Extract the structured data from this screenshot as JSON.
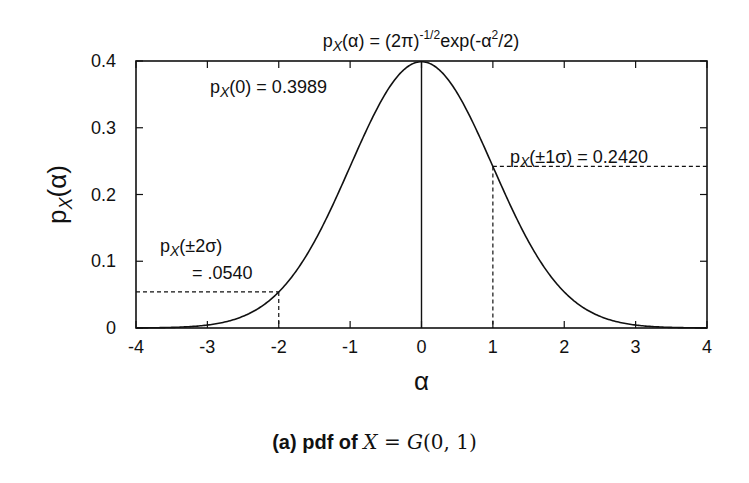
{
  "chart_data": {
    "type": "line",
    "title_parts": {
      "p": "p",
      "sub": "X",
      "mid": "(α) = (2π)",
      "sup1": "-1/2",
      "exp": "exp(-α",
      "sup2": "2",
      "end": "/2)"
    },
    "xlabel": "α",
    "ylabel": {
      "p": "p",
      "sub": "X",
      "rest": "(α)"
    },
    "xlim": [
      -4,
      4
    ],
    "ylim": [
      0,
      0.4
    ],
    "x_ticks": [
      "-4",
      "-3",
      "-2",
      "-1",
      "0",
      "1",
      "2",
      "3",
      "4"
    ],
    "y_ticks": [
      "0",
      "0.1",
      "0.2",
      "0.3",
      "0.4"
    ],
    "grid": false,
    "series": [
      {
        "name": "Standard normal pdf",
        "x": [
          -4,
          -3.5,
          -3,
          -2.5,
          -2,
          -1.5,
          -1,
          -0.5,
          0,
          0.5,
          1,
          1.5,
          2,
          2.5,
          3,
          3.5,
          4
        ],
        "values": [
          0.0001,
          0.0009,
          0.0044,
          0.0175,
          0.054,
          0.1295,
          0.242,
          0.3521,
          0.3989,
          0.3521,
          0.242,
          0.1295,
          0.054,
          0.0175,
          0.0044,
          0.0009,
          0.0001
        ]
      }
    ],
    "annotations": [
      {
        "label_p": "p",
        "label_sub": "X",
        "label_rest": "(0) = 0.3989",
        "x": 0,
        "y": 0.3989
      },
      {
        "label_p": "p",
        "label_sub": "X",
        "label_rest": "(±1σ) = 0.2420",
        "x": 1,
        "y": 0.242
      },
      {
        "label_p": "p",
        "label_sub": "X",
        "label_rest": "(±2σ)",
        "line2": "= .0540",
        "x": -2,
        "y": 0.054
      }
    ]
  },
  "caption": {
    "prefix": "(a)  pdf of ",
    "X": "X",
    "eq": " = ",
    "G": "G",
    "args": "(0, 1)"
  }
}
